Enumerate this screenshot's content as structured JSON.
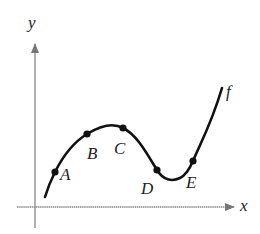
{
  "axes": {
    "x_label": "x",
    "y_label": "y",
    "axis_color": "#777777"
  },
  "curve": {
    "label": "f",
    "color": "#111111"
  },
  "points": [
    {
      "label": "A"
    },
    {
      "label": "B"
    },
    {
      "label": "C"
    },
    {
      "label": "D"
    },
    {
      "label": "E"
    }
  ]
}
